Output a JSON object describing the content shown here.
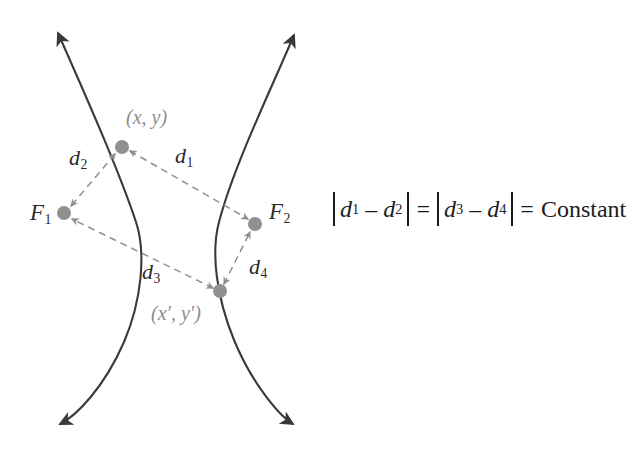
{
  "figure": {
    "colors": {
      "curve": "#3a3a3a",
      "dashed": "#8f8f8f",
      "point_marker": "#909090",
      "point_label_text": "#8d8d8d",
      "focus_label_text": "#2b2b2b",
      "equation_text": "#1c1c1c",
      "background": "#ffffff"
    },
    "points": [
      {
        "id": "P1",
        "label": "(x, y)",
        "x": 122,
        "y": 147
      },
      {
        "id": "P2",
        "label": "(x′, y′)",
        "x": 220,
        "y": 291
      },
      {
        "id": "F1",
        "label": "F",
        "subscript": "1",
        "x": 64,
        "y": 213
      },
      {
        "id": "F2",
        "label": "F",
        "subscript": "2",
        "x": 255,
        "y": 224
      }
    ],
    "distance_labels": [
      {
        "id": "d1",
        "label": "d",
        "subscript": "1",
        "from": "P1",
        "to": "F2",
        "x": 176,
        "y": 145
      },
      {
        "id": "d2",
        "label": "d",
        "subscript": "2",
        "from": "P1",
        "to": "F1",
        "x": 70,
        "y": 147
      },
      {
        "id": "d3",
        "label": "d",
        "subscript": "3",
        "from": "P2",
        "to": "F1",
        "x": 143,
        "y": 261
      },
      {
        "id": "d4",
        "label": "d",
        "subscript": "4",
        "from": "P2",
        "to": "F2",
        "x": 250,
        "y": 256
      }
    ],
    "curves": [
      {
        "id": "left-branch",
        "opens": "left",
        "vertex_x": 137,
        "vertex_y": 225,
        "arrow_top": {
          "x": 58,
          "y": 30
        },
        "arrow_bottom": {
          "x": 58,
          "y": 427
        }
      },
      {
        "id": "right-branch",
        "opens": "right",
        "vertex_x": 218,
        "vertex_y": 225,
        "arrow_top": {
          "x": 297,
          "y": 32
        },
        "arrow_bottom": {
          "x": 295,
          "y": 430
        }
      }
    ],
    "equation": {
      "d1": "d",
      "d1_sub": "1",
      "minus": "–",
      "d2": "d",
      "d2_sub": "2",
      "equals": "=",
      "d3": "d",
      "d3_sub": "3",
      "d4": "d",
      "d4_sub": "4",
      "result": "Constant",
      "plain_text": "|d1 – d2| = |d3 – d4| = Constant"
    }
  }
}
